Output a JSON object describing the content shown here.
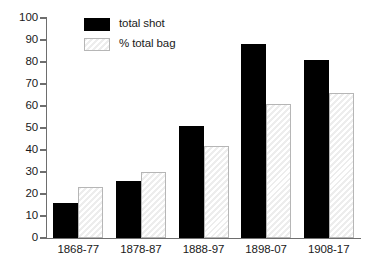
{
  "chart_data": {
    "type": "bar",
    "title": "",
    "subtitle": "",
    "xlabel": "",
    "ylabel": "",
    "categories": [
      "1868-77",
      "1878-87",
      "1888-97",
      "1898-07",
      "1908-17"
    ],
    "series": [
      {
        "name": "total shot",
        "color": "#000000",
        "values": [
          16,
          26,
          51,
          88,
          81
        ]
      },
      {
        "name": "% total bag",
        "color": "#ededed",
        "values": [
          23,
          30,
          42,
          61,
          66
        ]
      }
    ],
    "ylim": [
      0,
      100
    ],
    "ytick_labels": [
      "100",
      "90",
      "80",
      "70",
      "60",
      "50",
      "40",
      "30",
      "20",
      "10",
      "0"
    ],
    "ytick_values": [
      100,
      90,
      80,
      70,
      60,
      50,
      40,
      30,
      20,
      10,
      0
    ],
    "grid": false,
    "legend_position": "top-left",
    "legend": [
      {
        "label": "total shot",
        "swatch": "solid-black"
      },
      {
        "label": "% total bag",
        "swatch": "hatched-gray"
      }
    ]
  },
  "axis": {
    "line_color": "#6e6e6e",
    "text_color": "#1a1a1a"
  }
}
